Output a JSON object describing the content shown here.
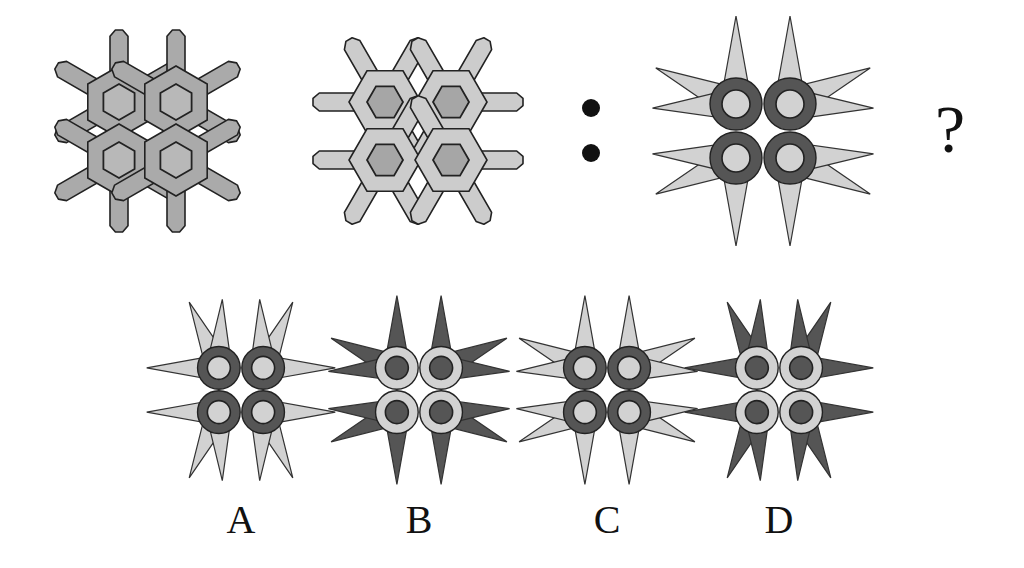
{
  "puzzle": {
    "type": "analogy",
    "question_mark": "?",
    "separator": ":",
    "colors": {
      "background": "#ffffff",
      "outline": "#222222",
      "fig1_fill": "#aaaaaa",
      "fig1_inner": "#b8b8b8",
      "fig2_fill": "#cccccc",
      "fig2_inner": "#a6a6a6",
      "dark": "#555555",
      "light": "#d2d2d2"
    },
    "figures": [
      {
        "id": "fig1",
        "description": "2x2 interlocking hexagon snowflakes, vertical arms, medium gray"
      },
      {
        "id": "fig2",
        "description": "2x2 interlocking hexagon snowflakes, horizontal arms, light gray with darker center hexagons"
      },
      {
        "id": "fig3",
        "description": "2x2 dark rings with light centers, light star spikes, spikes vertical"
      }
    ],
    "options": [
      {
        "label": "A",
        "rings": "dark",
        "centers": "light",
        "spikes": "light",
        "spike_orientation": "horizontal"
      },
      {
        "label": "B",
        "rings": "light",
        "centers": "dark",
        "spikes": "dark",
        "spike_orientation": "vertical"
      },
      {
        "label": "C",
        "rings": "dark",
        "centers": "light",
        "spikes": "light",
        "spike_orientation": "vertical"
      },
      {
        "label": "D",
        "rings": "light",
        "centers": "dark",
        "spikes": "dark",
        "spike_orientation": "horizontal"
      }
    ]
  }
}
